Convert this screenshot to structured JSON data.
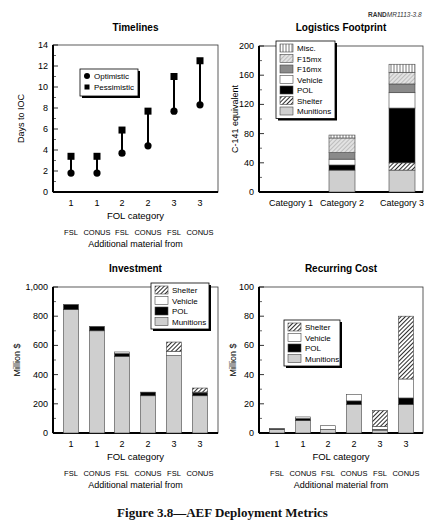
{
  "header": {
    "rand_label_bold": "RAND",
    "rand_label_id": "MR1113-3.8"
  },
  "caption": "Figure 3.8—AEF Deployment Metrics",
  "colors": {
    "munitions": "#cfcfcf",
    "shelter": "hatch",
    "pol": "#000000",
    "vehicle": "#ffffff",
    "f16mx": "#8a8a8a",
    "f15mx": "light-hatch",
    "misc": "vertical-stripes"
  },
  "chart_data": [
    {
      "id": "timelines",
      "type": "scatter",
      "title": "Timelines",
      "xlabel": "FOL category",
      "xlabel2": "Additional material from",
      "ylabel": "Days to IOC",
      "ylim": [
        0,
        14
      ],
      "yticks": [
        0,
        2,
        4,
        6,
        8,
        10,
        12,
        14
      ],
      "categories": [
        "1",
        "1",
        "2",
        "2",
        "3",
        "3"
      ],
      "sub_categories": [
        "FSL",
        "CONUS",
        "FSL",
        "CONUS",
        "FSL",
        "CONUS"
      ],
      "legend": [
        "Optimistic",
        "Pessimistic"
      ],
      "series": [
        {
          "name": "Optimistic",
          "marker": "circle",
          "values": [
            1.8,
            1.8,
            3.7,
            4.4,
            7.7,
            8.3
          ]
        },
        {
          "name": "Pessimistic",
          "marker": "square",
          "values": [
            3.4,
            3.4,
            5.9,
            7.7,
            11.0,
            12.5
          ]
        }
      ],
      "grid": false,
      "legend_position": "upper-left"
    },
    {
      "id": "logistics",
      "type": "bar",
      "stacked": true,
      "title": "Logistics Footprint",
      "xlabel": "",
      "ylabel": "C-141 equivalent",
      "ylim": [
        0,
        200
      ],
      "yticks": [
        0,
        40,
        80,
        120,
        160,
        200
      ],
      "categories": [
        "Category 1",
        "Category 2",
        "Category 3"
      ],
      "legend": [
        "Misc.",
        "F15mx",
        "F16mx",
        "Vehicle",
        "POL",
        "Shelter",
        "Munitions"
      ],
      "series": [
        {
          "name": "Munitions",
          "values": [
            0,
            30,
            30
          ]
        },
        {
          "name": "Shelter",
          "values": [
            0,
            0,
            10
          ]
        },
        {
          "name": "POL",
          "values": [
            0,
            7,
            75
          ]
        },
        {
          "name": "Vehicle",
          "values": [
            0,
            8,
            21
          ]
        },
        {
          "name": "F16mx",
          "values": [
            0,
            9,
            12
          ]
        },
        {
          "name": "F15mx",
          "values": [
            0,
            20,
            16
          ]
        },
        {
          "name": "Misc.",
          "values": [
            0,
            4,
            11
          ]
        }
      ],
      "totals": [
        0,
        78,
        175
      ],
      "grid": false,
      "legend_position": "upper-left"
    },
    {
      "id": "investment",
      "type": "bar",
      "stacked": true,
      "title": "Investment",
      "xlabel": "FOL category",
      "xlabel2": "Additional material from",
      "ylabel": "Million $",
      "ylim": [
        0,
        1000
      ],
      "yticks": [
        0,
        200,
        400,
        600,
        800,
        1000
      ],
      "ytick_labels": [
        "0",
        "200",
        "400",
        "600",
        "800",
        "1,000"
      ],
      "categories": [
        "1",
        "1",
        "2",
        "2",
        "3",
        "3"
      ],
      "sub_categories": [
        "FSL",
        "CONUS",
        "FSL",
        "CONUS",
        "FSL",
        "CONUS"
      ],
      "legend": [
        "Shelter",
        "Vehicle",
        "POL",
        "Munitions"
      ],
      "series": [
        {
          "name": "Munitions",
          "values": [
            845,
            700,
            525,
            255,
            530,
            255
          ]
        },
        {
          "name": "POL",
          "values": [
            35,
            30,
            20,
            25,
            0,
            20
          ]
        },
        {
          "name": "Vehicle",
          "values": [
            0,
            0,
            10,
            0,
            30,
            5
          ]
        },
        {
          "name": "Shelter",
          "values": [
            0,
            0,
            0,
            0,
            63,
            28
          ]
        }
      ],
      "grid": false,
      "legend_position": "upper-right"
    },
    {
      "id": "recurring",
      "type": "bar",
      "stacked": true,
      "title": "Recurring Cost",
      "xlabel": "FOL category",
      "xlabel2": "Additional material from",
      "ylabel": "Million $",
      "ylim": [
        0,
        100
      ],
      "yticks": [
        0,
        20,
        40,
        60,
        80,
        100
      ],
      "categories": [
        "1",
        "1",
        "2",
        "2",
        "3",
        "3"
      ],
      "sub_categories": [
        "FSL",
        "CONUS",
        "FSL",
        "CONUS",
        "FSL",
        "CONUS"
      ],
      "legend": [
        "Shelter",
        "Vehicle",
        "POL",
        "Munitions"
      ],
      "series": [
        {
          "name": "Munitions",
          "values": [
            2.5,
            8.5,
            2.5,
            19.5,
            2,
            19.5
          ]
        },
        {
          "name": "POL",
          "values": [
            0.5,
            1.5,
            0,
            2.5,
            0.5,
            4.5
          ]
        },
        {
          "name": "Vehicle",
          "values": [
            0,
            1,
            2.5,
            4.5,
            2,
            13
          ]
        },
        {
          "name": "Shelter",
          "values": [
            0,
            0,
            0,
            0,
            11,
            43
          ]
        }
      ],
      "grid": false,
      "legend_position": "center-left"
    }
  ]
}
